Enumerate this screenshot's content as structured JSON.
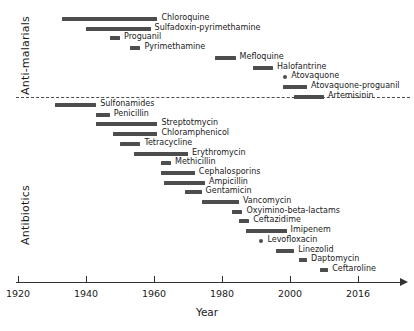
{
  "chart_data": {
    "type": "bar",
    "chart_style": "timeline-gantt",
    "title": "",
    "xlabel": "Year",
    "ylabel": "",
    "xlim": [
      1920,
      2016
    ],
    "xticks": [
      1920,
      1940,
      1960,
      1980,
      2000,
      2016
    ],
    "xtick_labels": [
      "1920",
      "1940",
      "1960",
      "1980",
      "2000",
      "2016"
    ],
    "grid": false,
    "legend": "none",
    "bar_color": "#4d4d4d",
    "axis_color": "#333333",
    "groups": [
      {
        "name": "Anti-malarials",
        "items": [
          {
            "label": "Chloroquine",
            "start": 1933,
            "end": 1961
          },
          {
            "label": "Sulfadoxin-pyrimethamine",
            "start": 1940,
            "end": 1959
          },
          {
            "label": "Proguanil",
            "start": 1947,
            "end": 1950
          },
          {
            "label": "Pyrimethamine",
            "start": 1953,
            "end": 1956
          },
          {
            "label": "Mefloquine",
            "start": 1978,
            "end": 1984
          },
          {
            "label": "Halofantrine",
            "start": 1989,
            "end": 1995
          },
          {
            "label": "Atovaquone",
            "start": 1998,
            "end": 1998
          },
          {
            "label": "Atovaquone-proguanil",
            "start": 1998,
            "end": 2004
          },
          {
            "label": "Artemisinin",
            "start": 2001,
            "end": 2008
          }
        ]
      },
      {
        "name": "Antibiotics",
        "items": [
          {
            "label": "Sulfonamides",
            "start": 1931,
            "end": 1943
          },
          {
            "label": "Penicillin",
            "start": 1943,
            "end": 1947
          },
          {
            "label": "Streptotmycin",
            "start": 1943,
            "end": 1961
          },
          {
            "label": "Chloramphenicol",
            "start": 1948,
            "end": 1961
          },
          {
            "label": "Tetracycline",
            "start": 1950,
            "end": 1956
          },
          {
            "label": "Erythromycin",
            "start": 1954,
            "end": 1970
          },
          {
            "label": "Methicillin",
            "start": 1962,
            "end": 1965
          },
          {
            "label": "Cephalosporins",
            "start": 1962,
            "end": 1972
          },
          {
            "label": "Ampicillin",
            "start": 1963,
            "end": 1975
          },
          {
            "label": "Gentamicin",
            "start": 1969,
            "end": 1974
          },
          {
            "label": "Vancomycin",
            "start": 1974,
            "end": 1985
          },
          {
            "label": "Oxyimino-beta-lactams",
            "start": 1983,
            "end": 1986
          },
          {
            "label": "Ceftazidime",
            "start": 1985,
            "end": 1988
          },
          {
            "label": "Imipenem",
            "start": 1987,
            "end": 1999
          },
          {
            "label": "Levofloxacin",
            "start": 1991,
            "end": 1991
          },
          {
            "label": "Linezolid",
            "start": 1996,
            "end": 2001
          },
          {
            "label": "Daptomycin",
            "start": 2002,
            "end": 2004
          },
          {
            "label": "Ceftaroline",
            "start": 2007,
            "end": 2009
          }
        ]
      }
    ]
  }
}
